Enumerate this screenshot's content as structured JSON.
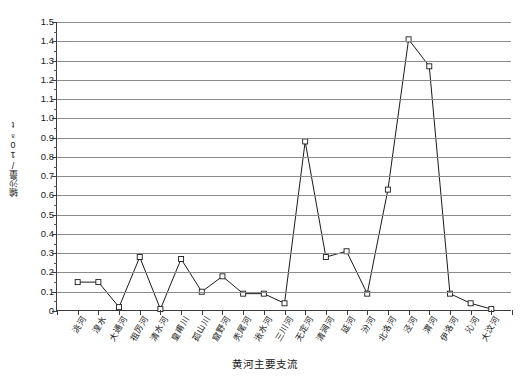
{
  "chart_data": {
    "type": "line",
    "title": "",
    "xlabel": "黄河主要支流",
    "ylabel": "输沙量/10⁸t",
    "ylim": [
      0,
      1.5
    ],
    "ytick_step": 0.1,
    "grid": true,
    "legend": "none",
    "marker": "open-square",
    "line_color": "#1a1a1a",
    "grid_color": "#8c8c8c",
    "axis_color": "#3b3b3b",
    "categories": [
      "洮河",
      "湟水",
      "大通河",
      "祖厉河",
      "清水河",
      "皇甫川",
      "孤山川",
      "窟野河",
      "秃尾河",
      "湫水河",
      "三川河",
      "无定河",
      "清涧河",
      "延河",
      "汾河",
      "北洛河",
      "泾河",
      "渭河",
      "伊洛河",
      "沁河",
      "大汶河"
    ],
    "values": [
      0.15,
      0.15,
      0.02,
      0.28,
      0.01,
      0.27,
      0.1,
      0.18,
      0.09,
      0.09,
      0.04,
      0.88,
      0.28,
      0.31,
      0.09,
      0.63,
      1.41,
      1.27,
      0.09,
      0.04,
      0.01
    ],
    "ytick_labels": [
      "0",
      "0.1",
      "0.2",
      "0.3",
      "0.4",
      "0.5",
      "0.6",
      "0.7",
      "0.8",
      "0.9",
      "1.0",
      "1.1",
      "1.2",
      "1.3",
      "1.4",
      "1.5"
    ]
  }
}
